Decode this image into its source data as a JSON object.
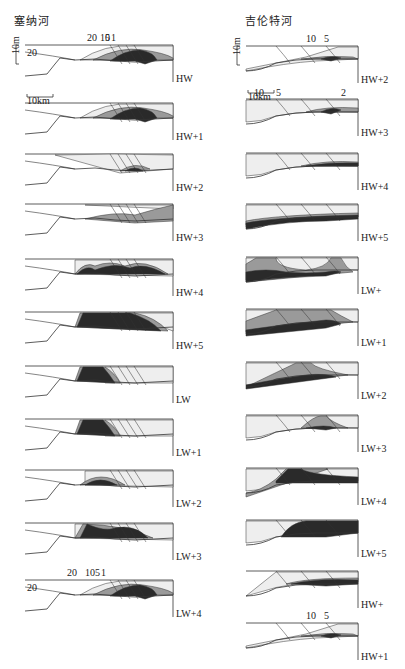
{
  "figure": {
    "left_column": {
      "title": "塞纳河",
      "panels": [
        {
          "stage": "HW",
          "contour_labels": [
            "20",
            "10",
            "5",
            "1"
          ],
          "side_label": "20",
          "vertical_scale": "10m"
        },
        {
          "stage": "HW+1",
          "horizontal_scale": "10km"
        },
        {
          "stage": "HW+2"
        },
        {
          "stage": "HW+3"
        },
        {
          "stage": "HW+4"
        },
        {
          "stage": "HW+5"
        },
        {
          "stage": "LW"
        },
        {
          "stage": "LW+1"
        },
        {
          "stage": "LW+2"
        },
        {
          "stage": "LW+3"
        },
        {
          "stage": "LW+4",
          "contour_labels": [
            "20",
            "10",
            "5",
            "1"
          ],
          "side_label": "20"
        }
      ]
    },
    "right_column": {
      "title": "吉伦特河",
      "panels": [
        {
          "stage": "HW+2",
          "contour_labels": [
            "10",
            "5"
          ],
          "vertical_scale": "10m"
        },
        {
          "stage": "HW+3",
          "contour_labels": [
            "10",
            "5",
            "2"
          ],
          "horizontal_scale": "10km"
        },
        {
          "stage": "HW+4"
        },
        {
          "stage": "HW+5"
        },
        {
          "stage": "LW+"
        },
        {
          "stage": "LW+1"
        },
        {
          "stage": "LW+2"
        },
        {
          "stage": "LW+3"
        },
        {
          "stage": "LW+4"
        },
        {
          "stage": "LW+5"
        },
        {
          "stage": "HW+"
        },
        {
          "stage": "HW+1",
          "contour_labels": [
            "10",
            "5"
          ]
        }
      ]
    },
    "colors": {
      "light_zone": "#eeeeee",
      "mid_zone": "#9a9a9a",
      "dark_zone": "#2a2a2a",
      "line": "#333333"
    }
  }
}
